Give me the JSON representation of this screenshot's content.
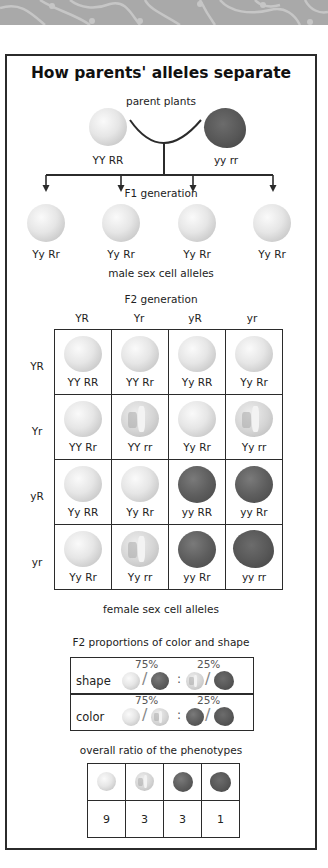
{
  "title": "How parents' alleles separate",
  "parents": {
    "label": "parent plants",
    "left": {
      "genotype": "YY RR",
      "phenotype": "yellow-round"
    },
    "right": {
      "genotype": "yy rr",
      "phenotype": "green-wrinkled"
    }
  },
  "f1": {
    "label": "F1 generation",
    "offspring": [
      {
        "genotype": "Yy Rr",
        "phenotype": "yellow-round"
      },
      {
        "genotype": "Yy Rr",
        "phenotype": "yellow-round"
      },
      {
        "genotype": "Yy Rr",
        "phenotype": "yellow-round"
      },
      {
        "genotype": "Yy Rr",
        "phenotype": "yellow-round"
      }
    ]
  },
  "punnett": {
    "male_label": "male sex cell alleles",
    "f2_label": "F2 generation",
    "female_label": "female sex cell alleles",
    "col_headers": [
      "YR",
      "Yr",
      "yR",
      "yr"
    ],
    "row_headers": [
      "YR",
      "Yr",
      "yR",
      "yr"
    ],
    "cells": [
      [
        {
          "genotype": "YY RR",
          "phenotype": "yellow-round"
        },
        {
          "genotype": "YY Rr",
          "phenotype": "yellow-round"
        },
        {
          "genotype": "Yy RR",
          "phenotype": "yellow-round"
        },
        {
          "genotype": "Yy Rr",
          "phenotype": "yellow-round"
        }
      ],
      [
        {
          "genotype": "YY Rr",
          "phenotype": "yellow-round"
        },
        {
          "genotype": "YY rr",
          "phenotype": "yellow-wrinkled"
        },
        {
          "genotype": "Yy Rr",
          "phenotype": "yellow-round"
        },
        {
          "genotype": "Yy rr",
          "phenotype": "yellow-wrinkled"
        }
      ],
      [
        {
          "genotype": "Yy RR",
          "phenotype": "yellow-round"
        },
        {
          "genotype": "Yy Rr",
          "phenotype": "yellow-round"
        },
        {
          "genotype": "yy RR",
          "phenotype": "green-round"
        },
        {
          "genotype": "yy Rr",
          "phenotype": "green-round"
        }
      ],
      [
        {
          "genotype": "Yy Rr",
          "phenotype": "yellow-round"
        },
        {
          "genotype": "Yy rr",
          "phenotype": "yellow-wrinkled"
        },
        {
          "genotype": "yy Rr",
          "phenotype": "green-round"
        },
        {
          "genotype": "yy rr",
          "phenotype": "green-wrinkled"
        }
      ]
    ]
  },
  "proportions": {
    "title": "F2 proportions of color and shape",
    "rows": [
      {
        "label": "shape",
        "dominant_pct": "75%",
        "recessive_pct": "25%",
        "dominant_peas": [
          "yellow-round",
          "green-round"
        ],
        "recessive_peas": [
          "yellow-wrinkled",
          "green-wrinkled"
        ],
        "slash": "/",
        "colon": ":"
      },
      {
        "label": "color",
        "dominant_pct": "75%",
        "recessive_pct": "25%",
        "dominant_peas": [
          "yellow-round",
          "yellow-wrinkled"
        ],
        "recessive_peas": [
          "green-round",
          "green-wrinkled"
        ],
        "slash": "/",
        "colon": ":"
      }
    ]
  },
  "ratio": {
    "title": "overall ratio of the phenotypes",
    "phenotypes": [
      "yellow-round",
      "yellow-wrinkled",
      "green-round",
      "green-wrinkled"
    ],
    "counts": [
      "9",
      "3",
      "3",
      "1"
    ]
  },
  "colors": {
    "frame": "#2b2b2b",
    "banner": "#a9a9a9",
    "banner_lines": "#c8c8c8"
  }
}
